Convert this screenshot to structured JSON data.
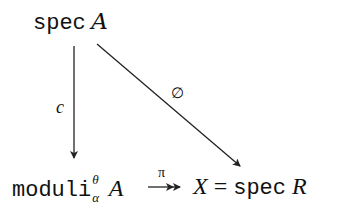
{
  "diagram": {
    "type": "commutative-diagram",
    "nodes": {
      "top": {
        "prefix": "spec",
        "object": "A"
      },
      "bottom_left": {
        "prefix": "moduli",
        "superscript": "θ",
        "subscript": "α",
        "object": "A"
      },
      "bottom_right": {
        "lhs": "X",
        "eq": "=",
        "prefix": "spec",
        "object": "R"
      }
    },
    "arrows": [
      {
        "from": "top",
        "to": "bottom_left",
        "label": "c",
        "style": "single-head"
      },
      {
        "from": "top",
        "to": "bottom_right",
        "label": "∅",
        "style": "single-head"
      },
      {
        "from": "bottom_left",
        "to": "bottom_right",
        "label": "π",
        "style": "double-head (surjection)"
      }
    ]
  }
}
